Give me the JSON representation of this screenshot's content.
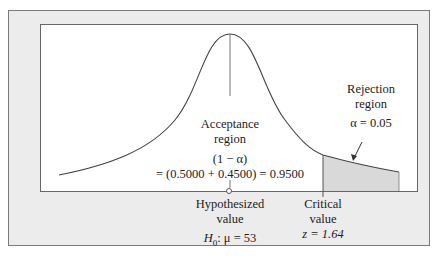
{
  "diagram": {
    "type": "hypothesis-test-normal-curve",
    "acceptance": {
      "title_line1": "Acceptance",
      "title_line2": "region",
      "formula_line1": "(1 − α)",
      "formula_line2": "= (0.5000 + 0.4500) = 0.9500"
    },
    "rejection": {
      "title_line1": "Rejection",
      "title_line2": "region",
      "alpha": "α = 0.05"
    },
    "hypothesized": {
      "line1": "Hypothesized",
      "line2": "value",
      "h0_symbol": "H",
      "h0_sub": "0",
      "h0_rest": ": μ = 53"
    },
    "critical": {
      "line1": "Critical",
      "line2": "value",
      "z": "z = 1.64"
    },
    "colors": {
      "frame_bg": "#ececec",
      "panel_bg": "#ffffff",
      "shade": "#d9d9d9",
      "line": "#444444"
    }
  }
}
